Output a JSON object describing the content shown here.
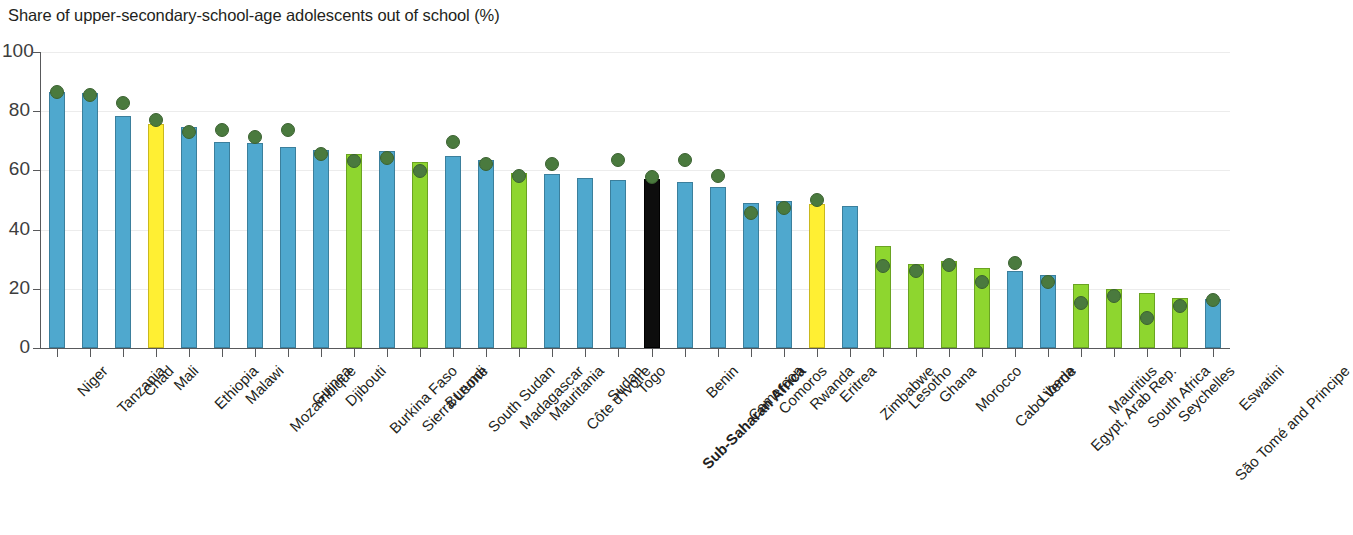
{
  "chart_data": {
    "type": "bar",
    "title": "Share of upper-secondary-school-age adolescents out of school (%)",
    "xlabel": "",
    "ylabel": "",
    "ylim": [
      0,
      100
    ],
    "yticks": [
      0,
      20,
      40,
      60,
      80,
      100
    ],
    "ytick_labels": [
      "0",
      "20",
      "40",
      "60",
      "80",
      "100"
    ],
    "grid": true,
    "legend": "none",
    "categories": [
      "Niger",
      "Tanzania",
      "Chad",
      "Mali",
      "Ethiopia",
      "Malawi",
      "Mozambique",
      "Guinea",
      "Djibouti",
      "Burkina Faso",
      "Sierra Leone",
      "Burundi",
      "South Sudan",
      "Madagascar",
      "Mauritania",
      "Côte d'Ivoire",
      "Sudan",
      "Togo",
      "Sub-Saharan Africa",
      "Benin",
      "Cameroon",
      "Comoros",
      "Rwanda",
      "Eritrea",
      "Zimbabwe",
      "Lesotho",
      "Ghana",
      "Morocco",
      "Cabo Verde",
      "Liberia",
      "Egypt, Arab Rep.",
      "Mauritius",
      "South Africa",
      "Seychelles",
      "São Tomé and Principe",
      "Eswatini"
    ],
    "series": [
      {
        "name": "Total",
        "type": "bar",
        "values": [
          86.5,
          86.0,
          78.5,
          75.8,
          74.5,
          69.5,
          69.3,
          68.0,
          67.0,
          65.5,
          66.5,
          63.0,
          64.8,
          63.5,
          59.0,
          58.8,
          57.5,
          56.8,
          57.0,
          56.0,
          54.3,
          49.0,
          49.5,
          48.8,
          48.0,
          34.3,
          28.5,
          29.5,
          27.0,
          26.0,
          24.5,
          21.5,
          20.0,
          18.5,
          17.0,
          16.5
        ]
      },
      {
        "name": "Female",
        "type": "scatter",
        "values": [
          89.0,
          88.0,
          85.0,
          79.5,
          75.5,
          76.0,
          73.5,
          76.0,
          67.8,
          65.5,
          66.5,
          62.0,
          72.0,
          64.5,
          60.5,
          64.5,
          null,
          66.0,
          60.0,
          66.0,
          60.5,
          48.0,
          49.5,
          52.5,
          null,
          30.0,
          28.5,
          30.5,
          24.5,
          31.0,
          24.5,
          17.5,
          20.0,
          12.5,
          16.5,
          18.5
        ]
      }
    ],
    "bar_colors": [
      "blue",
      "blue",
      "blue",
      "yellow",
      "blue",
      "blue",
      "blue",
      "blue",
      "blue",
      "green",
      "blue",
      "green",
      "blue",
      "blue",
      "green",
      "blue",
      "blue",
      "blue",
      "black",
      "blue",
      "blue",
      "blue",
      "blue",
      "yellow",
      "blue",
      "green",
      "green",
      "green",
      "green",
      "blue",
      "blue",
      "green",
      "green",
      "green",
      "green",
      "blue"
    ],
    "bold_labels": [
      "Sub-Saharan Africa"
    ],
    "colors": {
      "blue": "#4fa8ce",
      "green": "#8ed62f",
      "yellow": "#ffef33",
      "black": "#0d0d0d",
      "dot": "#4a7a3e",
      "axis": "#58595b",
      "grid": "#ececec",
      "text": "#231f20"
    }
  }
}
